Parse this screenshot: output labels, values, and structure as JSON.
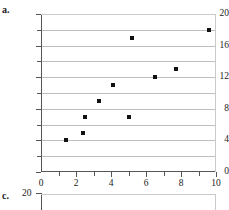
{
  "figure": {
    "panel_a_letter": "a.",
    "panel_c_letter": "c.",
    "panel_c_ylabel_top": "20"
  },
  "chart_data": {
    "type": "scatter",
    "title": "",
    "xlabel": "",
    "ylabel": "",
    "xlim": [
      0,
      10
    ],
    "ylim": [
      0,
      20
    ],
    "grid": true,
    "grid_spacing_y": 2,
    "legend": "none",
    "x_major_ticks": [
      0,
      2,
      4,
      6,
      8,
      10
    ],
    "x_minor_ticks": [
      1,
      3,
      5,
      7,
      9
    ],
    "x_tick_labels": [
      "0",
      "2",
      "4",
      "6",
      "8",
      "10"
    ],
    "y_major_ticks": [
      0,
      4,
      8,
      12,
      16,
      20
    ],
    "y_minor_ticks": [
      2,
      6,
      10,
      14,
      18
    ],
    "y_tick_labels": [
      "0",
      "4",
      "8",
      "12",
      "16",
      "20"
    ],
    "points": [
      {
        "x": 1.4,
        "y": 4
      },
      {
        "x": 2.4,
        "y": 5
      },
      {
        "x": 2.5,
        "y": 7
      },
      {
        "x": 3.3,
        "y": 9
      },
      {
        "x": 4.1,
        "y": 11
      },
      {
        "x": 5.0,
        "y": 7
      },
      {
        "x": 5.2,
        "y": 17
      },
      {
        "x": 6.5,
        "y": 12
      },
      {
        "x": 7.7,
        "y": 13
      },
      {
        "x": 9.6,
        "y": 18
      }
    ],
    "colors": {
      "marker": "#111111",
      "gridline": "#bdbec0",
      "axis": "#55565a",
      "background": "#ffffff"
    }
  }
}
